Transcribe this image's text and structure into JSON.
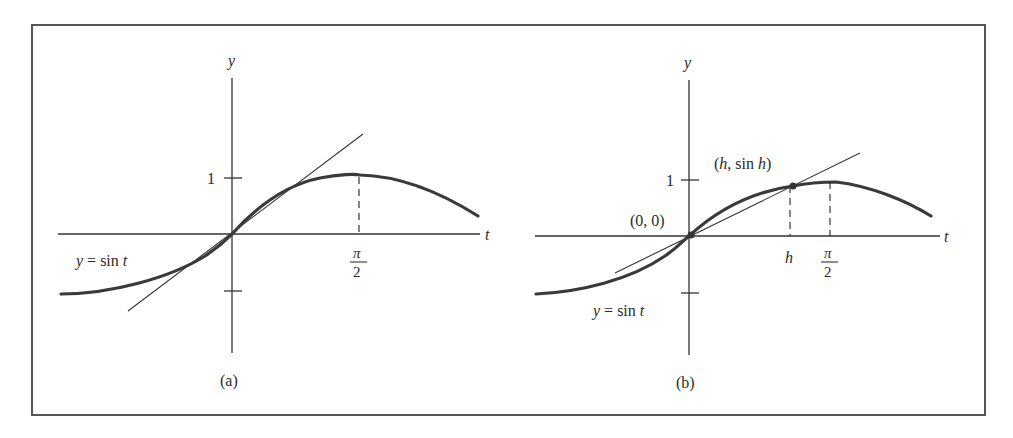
{
  "figure": {
    "panels": [
      {
        "id": "a",
        "caption": "(a)",
        "y_axis_label": "y",
        "t_axis_label": "t",
        "y_tick_label": "1",
        "pi_num": "π",
        "pi_den": "2",
        "curve_label_y": "y",
        "curve_label_eq": " = sin ",
        "curve_label_t": "t",
        "line_type": "tangent at origin"
      },
      {
        "id": "b",
        "caption": "(b)",
        "y_axis_label": "y",
        "t_axis_label": "t",
        "y_tick_label": "1",
        "h_label": "h",
        "pi_num": "π",
        "pi_den": "2",
        "origin_point_label": "(0, 0)",
        "point_h_open": "(",
        "point_h_h": "h",
        "point_h_mid": ", sin ",
        "point_h_h2": "h",
        "point_h_close": ")",
        "curve_label_y": "y",
        "curve_label_eq": " = sin ",
        "curve_label_t": "t",
        "line_type": "secant through (0,0) and (h, sin h)"
      }
    ],
    "colors": {
      "ink": "#333333",
      "frame": "#555555",
      "background": "#ffffff"
    }
  }
}
